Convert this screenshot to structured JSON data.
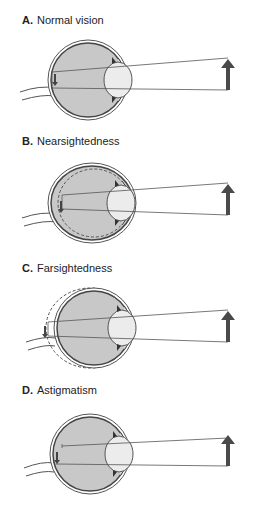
{
  "figure": {
    "panels": [
      {
        "letter": "A.",
        "label": "Normal vision",
        "condition": "normal",
        "focus": "on retina"
      },
      {
        "letter": "B.",
        "label": "Nearsightedness",
        "condition": "myopia",
        "focus": "in front of retina"
      },
      {
        "letter": "C.",
        "label": "Farsightedness",
        "condition": "hyperopia",
        "focus": "behind retina"
      },
      {
        "letter": "D.",
        "label": "Astigmatism",
        "condition": "astigmatism",
        "focus": "multiple focal points"
      }
    ]
  },
  "colors": {
    "eye_fill": "#c8c8c8",
    "lens_fill": "#ececec",
    "outline": "#444444",
    "object_arrow": "#4a4a4a",
    "light_ray": "#555555"
  }
}
